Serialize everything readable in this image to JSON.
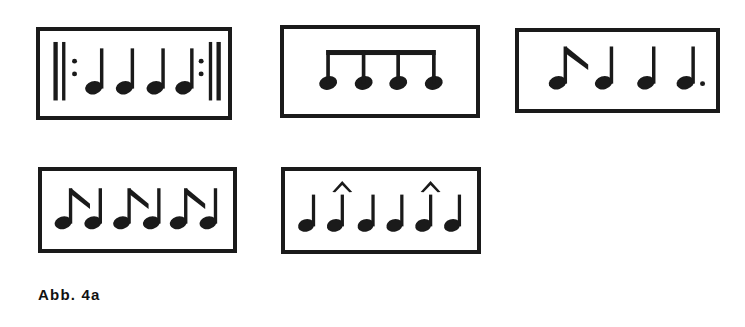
{
  "figure": {
    "caption": "Abb. 4a",
    "ink_color": "#1a1a1a",
    "background_color": "#ffffff",
    "box_count": 5,
    "boxes": [
      {
        "id": "box-1",
        "name": "rhythm-pattern-box-1",
        "x": 36,
        "y": 27,
        "width": 196,
        "height": 93,
        "description": "repeat sign followed by four quarter notes and closing repeat sign",
        "elements": [
          {
            "type": "repeat-barline-open",
            "x": 18
          },
          {
            "type": "quarter-note",
            "x": 60
          },
          {
            "type": "quarter-note",
            "x": 92
          },
          {
            "type": "quarter-note",
            "x": 124
          },
          {
            "type": "quarter-note",
            "x": 156
          },
          {
            "type": "repeat-barline-close",
            "x": 180
          }
        ]
      },
      {
        "id": "box-2",
        "name": "rhythm-pattern-box-2",
        "x": 280,
        "y": 25,
        "width": 200,
        "height": 93,
        "description": "four eighth notes joined by a single beam",
        "elements": [
          {
            "type": "beamed-eighth-group",
            "count": 4,
            "x": 48
          }
        ]
      },
      {
        "id": "box-3",
        "name": "rhythm-pattern-box-3",
        "x": 515,
        "y": 28,
        "width": 205,
        "height": 85,
        "description": "flagged eighth note, two quarter notes, dotted quarter note",
        "elements": [
          {
            "type": "eighth-note-flagged",
            "x": 44
          },
          {
            "type": "quarter-note",
            "x": 96
          },
          {
            "type": "quarter-note",
            "x": 140
          },
          {
            "type": "dotted-quarter-note",
            "x": 182
          }
        ]
      },
      {
        "id": "box-4",
        "name": "rhythm-pattern-box-4",
        "x": 38,
        "y": 167,
        "width": 199,
        "height": 86,
        "description": "three pairs of a flagged eighth note followed by a quarter note",
        "elements": [
          {
            "type": "eighth-note-flagged",
            "x": 30
          },
          {
            "type": "quarter-note",
            "x": 62
          },
          {
            "type": "eighth-note-flagged",
            "x": 92
          },
          {
            "type": "quarter-note",
            "x": 124
          },
          {
            "type": "eighth-note-flagged",
            "x": 152
          },
          {
            "type": "quarter-note",
            "x": 184
          }
        ]
      },
      {
        "id": "box-5",
        "name": "rhythm-pattern-box-5",
        "x": 281,
        "y": 167,
        "width": 200,
        "height": 87,
        "description": "six quarter notes with marcato accents above the second and fifth notes",
        "elements": [
          {
            "type": "quarter-note",
            "x": 28,
            "accent": false
          },
          {
            "type": "quarter-note",
            "x": 58,
            "accent": true
          },
          {
            "type": "quarter-note",
            "x": 90,
            "accent": false
          },
          {
            "type": "quarter-note",
            "x": 120,
            "accent": false
          },
          {
            "type": "quarter-note",
            "x": 150,
            "accent": true
          },
          {
            "type": "quarter-note",
            "x": 180,
            "accent": false
          }
        ]
      }
    ]
  }
}
